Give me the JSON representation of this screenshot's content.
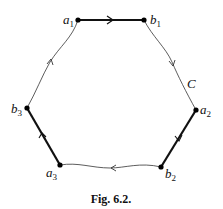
{
  "figure": {
    "caption": "Fig. 6.2.",
    "curve_label": "C",
    "points": [
      {
        "name": "a",
        "sub": "1",
        "x": 78,
        "y": 20
      },
      {
        "name": "b",
        "sub": "1",
        "x": 144,
        "y": 20
      },
      {
        "name": "a",
        "sub": "2",
        "x": 196,
        "y": 110
      },
      {
        "name": "b",
        "sub": "2",
        "x": 161,
        "y": 167
      },
      {
        "name": "a",
        "sub": "3",
        "x": 60,
        "y": 165
      },
      {
        "name": "b",
        "sub": "3",
        "x": 27,
        "y": 108
      }
    ],
    "thick_segments": [
      "a1-b1",
      "a2-b2",
      "a3-b3"
    ],
    "thin_curves": [
      "b1-a2",
      "b2-a3",
      "b3-a1"
    ],
    "orientation": "clockwise"
  }
}
